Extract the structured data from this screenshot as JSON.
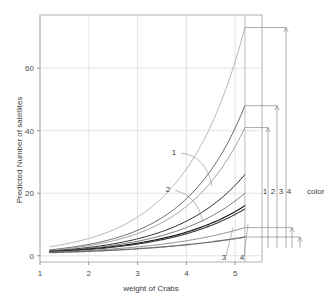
{
  "chart_data": {
    "type": "line",
    "title": "",
    "xlabel": "weight of Crabs",
    "ylabel": "Predicted Number of satellites",
    "xlim": [
      1,
      5.55
    ],
    "ylim": [
      -2,
      77
    ],
    "xticks": [
      "1",
      "2",
      "3",
      "4",
      "5"
    ],
    "xtick_values": [
      1,
      2,
      3,
      4,
      5
    ],
    "yticks": [
      "0",
      "20",
      "40",
      "60"
    ],
    "ytick_values": [
      0,
      20,
      40,
      60
    ],
    "grid": true,
    "legend_position": "right",
    "legend_title": "color",
    "legend_entries": [
      "1",
      "2",
      "3",
      "4"
    ],
    "x_domain_start": 1.2,
    "x_domain_end": 5.2,
    "series": [
      {
        "name": "color 1",
        "label": "1",
        "start_value": 2.9,
        "end_value": 73.0,
        "color": "#9a9a9a",
        "width": 0.7
      },
      {
        "name": "color 2",
        "label": "2",
        "start_value": 1.9,
        "end_value": 48.0,
        "color": "#5a5a5a",
        "width": 0.9
      },
      {
        "name": "color 2b",
        "label": "2",
        "start_value": 1.7,
        "end_value": 41.0,
        "color": "#8a8a8a",
        "width": 0.8
      },
      {
        "name": "color 3",
        "label": "3",
        "start_value": 1.5,
        "end_value": 26.0,
        "color": "#2a2a2a",
        "width": 1.0
      },
      {
        "name": "color 3b",
        "label": "3",
        "start_value": 1.4,
        "end_value": 20.0,
        "color": "#6a6a6a",
        "width": 0.9
      },
      {
        "name": "color 4",
        "label": "4",
        "start_value": 1.3,
        "end_value": 16.0,
        "color": "#1a1a1a",
        "width": 1.2
      },
      {
        "name": "color 4b",
        "label": "4",
        "start_value": 1.2,
        "end_value": 15.0,
        "color": "#3a3a3a",
        "width": 1.1
      },
      {
        "name": "color low",
        "label": "",
        "start_value": 1.1,
        "end_value": 9.0,
        "color": "#909090",
        "width": 1.0
      },
      {
        "name": "color lowest",
        "label": "",
        "start_value": 1.0,
        "end_value": 6.0,
        "color": "#707070",
        "width": 1.4
      }
    ],
    "annotations": [
      {
        "text": "1",
        "x_px": 174,
        "y_px": 155
      },
      {
        "text": "2",
        "x_px": 168,
        "y_px": 192
      },
      {
        "text": "3",
        "x_px": 224,
        "y_px": 260
      },
      {
        "text": "4",
        "x_px": 242,
        "y_px": 260
      }
    ],
    "bracket_values": [
      73.0,
      48.0,
      41.0,
      9.0,
      6.0
    ]
  }
}
